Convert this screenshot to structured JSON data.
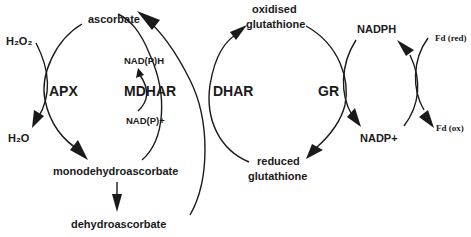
{
  "diagram": {
    "metabolites": {
      "h2o2": "H₂O₂",
      "h2o": "H₂O",
      "ascorbate": "ascorbate",
      "monodehydroascorbate": "monodehydroascorbate",
      "dehydroascorbate": "dehydroascorbate",
      "nadph_mdhar": "NAD(P)H",
      "nadp_mdhar": "NAD(P)+",
      "oxidised_glutathione_1": "oxidised",
      "oxidised_glutathione_2": "glutathione",
      "reduced_glutathione_1": "reduced",
      "reduced_glutathione_2": "glutathione",
      "nadph": "NADPH",
      "nadp": "NADP+",
      "fd_red": "Fd (red)",
      "fd_ox": "Fd (ox)"
    },
    "enzymes": {
      "apx": "APX",
      "mdhar": "MDHAR",
      "dhar": "DHAR",
      "gr": "GR"
    },
    "colors": {
      "ink": "#1a1a1a",
      "background": "#ffffff"
    }
  }
}
